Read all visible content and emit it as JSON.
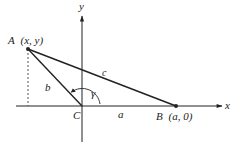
{
  "figure": {
    "type": "triangle-on-coordinate-axes",
    "axes": {
      "x_label": "x",
      "y_label": "y"
    },
    "points": {
      "A": {
        "label": "A",
        "coords": "(x, y)"
      },
      "B": {
        "label": "B",
        "coords": "(a, 0)"
      },
      "C": {
        "label": "C"
      }
    },
    "sides": {
      "a": "a",
      "b": "b",
      "c": "c"
    },
    "angle": {
      "label": "γ",
      "at": "C"
    },
    "colors": {
      "ink": "#222222",
      "background": "#ffffff"
    }
  }
}
